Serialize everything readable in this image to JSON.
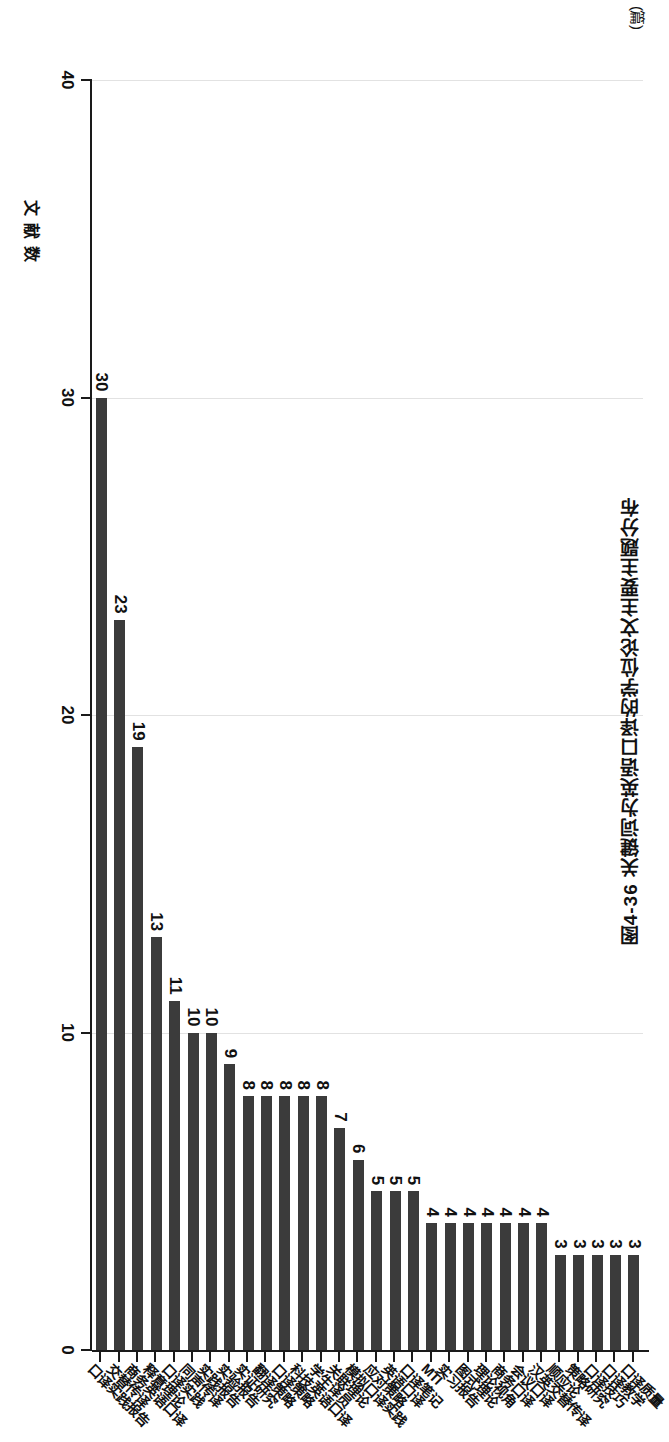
{
  "figure": {
    "caption": "图4-36  关键词为英语口译的学位论文主要主题分布",
    "unit_label": "(篇)"
  },
  "chart_data": {
    "type": "bar",
    "orientation": "horizontal",
    "title": "关键词为英语口译的学位论文主要主题分布",
    "xlabel": "",
    "ylabel": "文献数",
    "unit": "篇",
    "ylim": [
      0,
      40
    ],
    "yticks": [
      0,
      10,
      20,
      30,
      40
    ],
    "grid": true,
    "legend": null,
    "bar_color": "#3b3b3b",
    "categories": [
      "口译质量",
      "口译教学",
      "口译技巧",
      "策略研究",
      "顺应论",
      "汉英交替传译",
      "会议口译",
      "商务口译",
      "理论视角",
      "图式理论",
      "实习报告",
      "MTI",
      "口译笔记",
      "英语口译",
      "应对策略",
      "模拟口译实践",
      "关联理论",
      "学生译员",
      "科技英语口译",
      "口译策略",
      "翻译策略",
      "实证研究",
      "实验报告",
      "实践报告",
      "同声传译",
      "口译实践",
      "释意理论",
      "商务英语口译",
      "交替传译",
      "口译实践报告"
    ],
    "values": [
      3,
      3,
      3,
      3,
      3,
      4,
      4,
      4,
      4,
      4,
      4,
      4,
      5,
      5,
      5,
      6,
      7,
      8,
      8,
      8,
      8,
      8,
      9,
      10,
      10,
      11,
      13,
      19,
      23,
      30
    ]
  },
  "axis": {
    "tick_labels": [
      "40",
      "30",
      "20",
      "10",
      "0"
    ]
  }
}
